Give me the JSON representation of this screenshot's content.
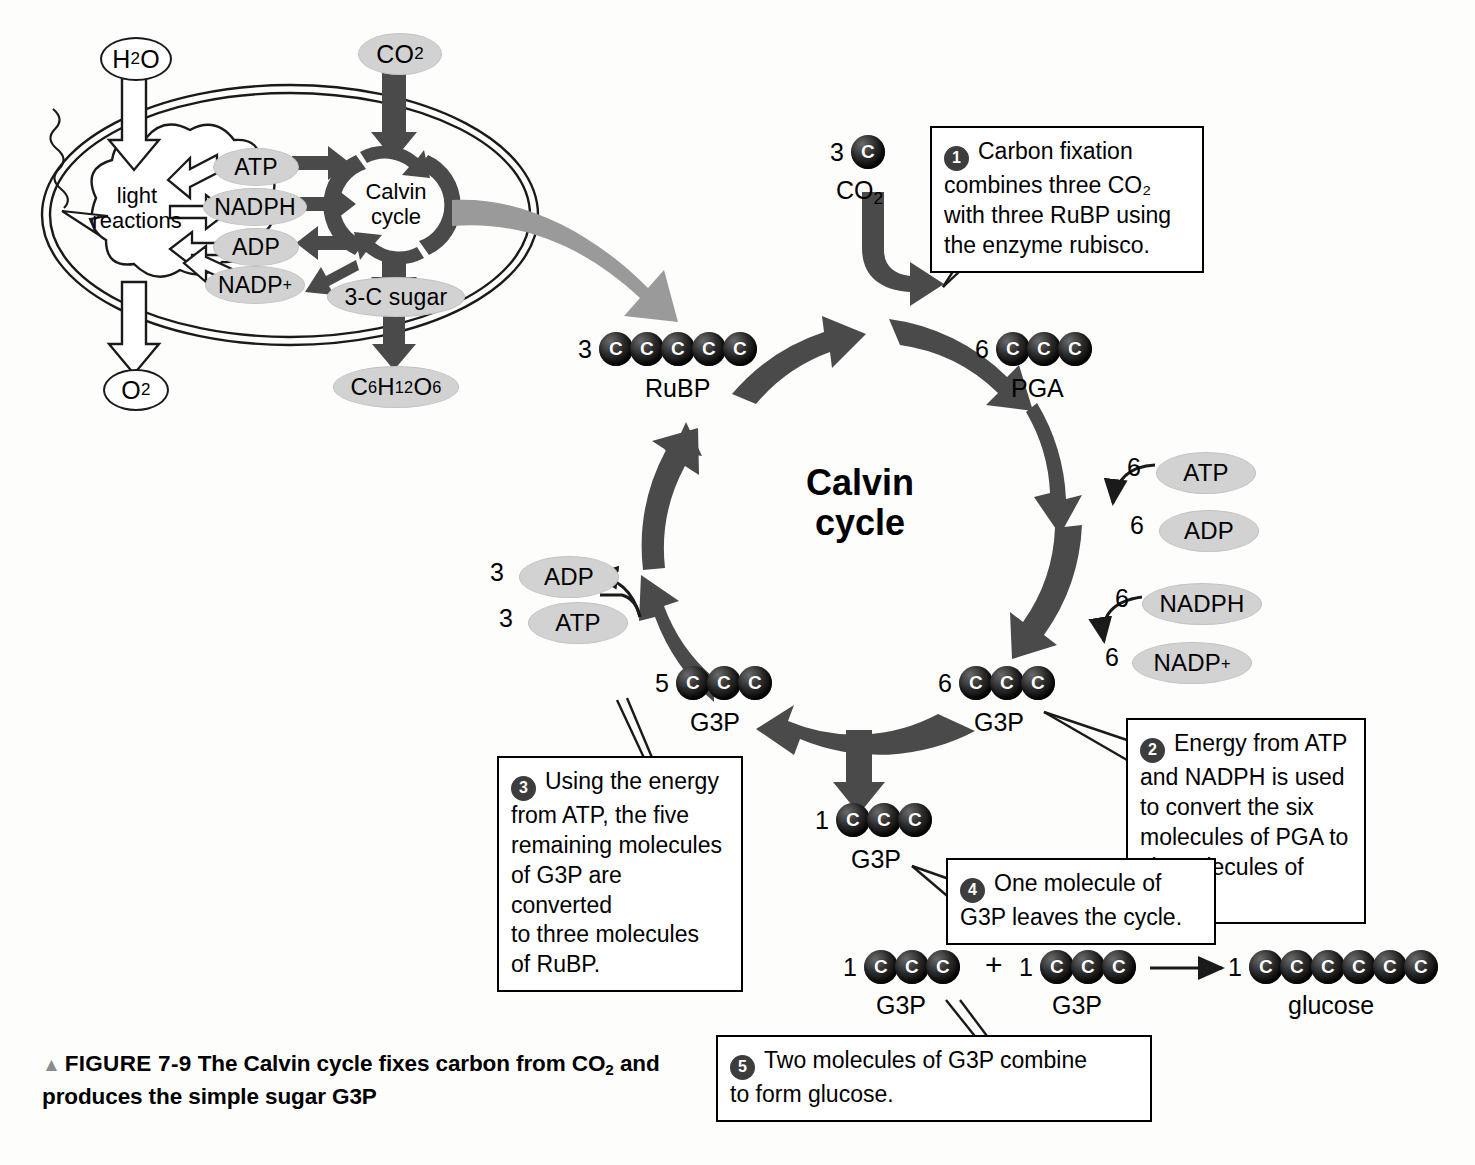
{
  "figure": {
    "triangle": "▲",
    "label": "FIGURE 7-9",
    "caption_a": "The Calvin cycle fixes carbon from CO",
    "caption_sub": "2",
    "caption_b": " and",
    "caption_line2": "produces the simple sugar G3P"
  },
  "center_title": "Calvin\ncycle",
  "inset": {
    "h2o": "H",
    "h2o_sub": "2",
    "h2o_tail": "O",
    "o2": "O",
    "o2_sub": "2",
    "co2": "CO",
    "co2_sub": "2",
    "light_reactions": "light\nreactions",
    "calvin_cycle": "Calvin\ncycle",
    "atp": "ATP",
    "nadph": "NADPH",
    "adp": "ADP",
    "nadp": "NADP",
    "nadp_sup": "+",
    "three_c_sugar": "3-C sugar",
    "glucose_formula_c": "C",
    "glucose_formula_6": "6",
    "glucose_formula_h": "H",
    "glucose_formula_12": "12",
    "glucose_formula_o": "O",
    "glucose_formula_6b": "6"
  },
  "molecules": {
    "co2_input": {
      "count": "3",
      "carbons": 1,
      "label": "CO",
      "label_sub": "2"
    },
    "pga": {
      "count": "6",
      "carbons": 3,
      "label": "PGA"
    },
    "g3p_six": {
      "count": "6",
      "carbons": 3,
      "label": "G3P"
    },
    "g3p_five": {
      "count": "5",
      "carbons": 3,
      "label": "G3P"
    },
    "rubp": {
      "count": "3",
      "carbons": 5,
      "label": "RuBP"
    },
    "g3p_one": {
      "count": "1",
      "carbons": 3,
      "label": "G3P"
    },
    "g3p_bottom_left": {
      "count": "1",
      "carbons": 3,
      "label": "G3P"
    },
    "g3p_bottom_right": {
      "count": "1",
      "carbons": 3,
      "label": "G3P"
    },
    "glucose": {
      "count": "1",
      "carbons": 6,
      "label": "glucose"
    }
  },
  "cofactors": {
    "atp_right": {
      "count": "6",
      "name": "ATP"
    },
    "adp_right": {
      "count": "6",
      "name": "ADP"
    },
    "nadph_right": {
      "count": "6",
      "name": "NADPH"
    },
    "nadp_right": {
      "count": "6",
      "name": "NADP",
      "sup": "+"
    },
    "adp_left": {
      "count": "3",
      "name": "ADP"
    },
    "atp_left": {
      "count": "3",
      "name": "ATP"
    }
  },
  "glyphs": {
    "plus": "+",
    "arrow": "→"
  },
  "callouts": [
    {
      "num": "1",
      "lines": [
        "Carbon fixation",
        "combines three CO₂",
        "with three RuBP using",
        "the enzyme rubisco."
      ],
      "text": "Carbon fixation combines three CO2 with three RuBP using the enzyme rubisco."
    },
    {
      "num": "2",
      "lines": [
        "Energy from ATP",
        "and NADPH is used",
        "to convert the six",
        "molecules of PGA to",
        "six molecules of G3P."
      ],
      "text": "Energy from ATP and NADPH is used to convert the six molecules of PGA to six molecules of G3P."
    },
    {
      "num": "3",
      "lines": [
        "Using the energy",
        "from ATP, the five",
        "remaining molecules",
        "of G3P are converted",
        "to three molecules",
        "of RuBP."
      ],
      "text": "Using the energy from ATP, the five remaining molecules of G3P are converted to three molecules of RuBP."
    },
    {
      "num": "4",
      "lines": [
        "One molecule of",
        "G3P leaves the cycle."
      ],
      "text": "One molecule of G3P leaves the cycle."
    },
    {
      "num": "5",
      "lines": [
        "Two molecules of G3P combine",
        "to form glucose."
      ],
      "text": "Two molecules of G3P combine to form glucose."
    }
  ],
  "colors": {
    "arrow_dark": "#4a4a4a",
    "pill_gray": "#d2d2d2",
    "inset_link_arrow": "#9a9a9a",
    "step_badge": "#3d3d3d",
    "ink": "#000000"
  }
}
